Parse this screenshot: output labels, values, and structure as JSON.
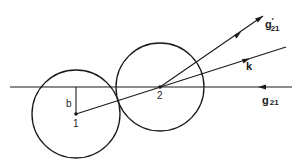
{
  "figure": {
    "background": "#ffffff",
    "stroke_color": "#1a1a1a",
    "points": [
      {
        "id": "1",
        "label": "1",
        "x": 76,
        "y": 114
      },
      {
        "id": "2",
        "label": "2",
        "x": 160,
        "y": 87
      }
    ],
    "circles": [
      {
        "id": "circle-1",
        "cx": 76,
        "cy": 114,
        "r": 44
      },
      {
        "id": "circle-2",
        "cx": 160,
        "cy": 87,
        "r": 44
      }
    ],
    "labels": {
      "impact_parameter": "b",
      "point_1": "1",
      "point_2": "2",
      "k_vector": "k",
      "g_prime": "g",
      "g_prime_mark": "′",
      "g_prime_sub": "21",
      "g": "g",
      "g_sub": "21"
    }
  }
}
